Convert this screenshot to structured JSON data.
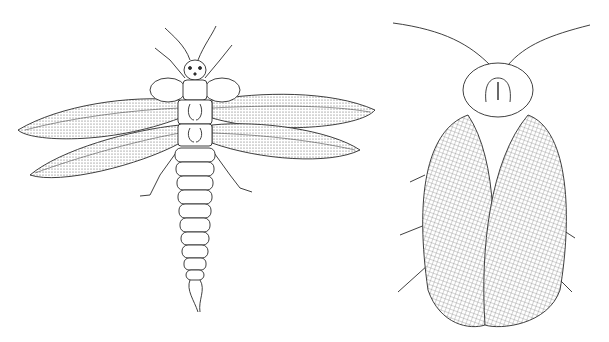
{
  "image": {
    "subject": "Scientific engraving of two insects",
    "background": "#ffffff",
    "ink": "#2a2a2a",
    "figures": [
      {
        "name": "winged-insect-left",
        "description": "Stonefly-like insect with four outstretched mesh wings, segmented abdomen, two cerci"
      },
      {
        "name": "cockroach-right",
        "description": "Roach-like insect seen from above with rounded pronotum, long antennae and net-veined wings"
      }
    ]
  }
}
